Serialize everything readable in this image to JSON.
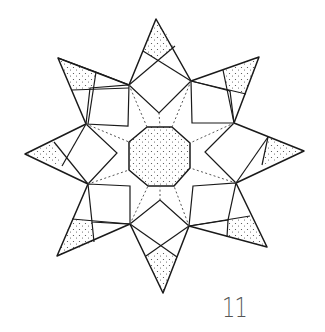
{
  "figure": {
    "page_number": "11",
    "colors": {
      "line": "#1a1a1a",
      "dots": "#555555",
      "background": "#ffffff",
      "label": "#555555"
    },
    "parts": {
      "center": "stippled octagon",
      "arms": 8,
      "arm_tips": "stippled triangles/quads",
      "guides": "dotted fold lines from inner vertices to octagon"
    }
  }
}
